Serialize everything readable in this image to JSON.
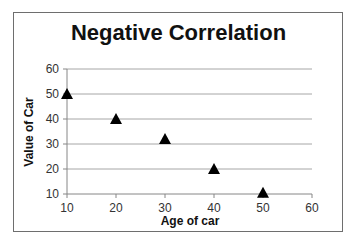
{
  "chart_data": {
    "type": "scatter",
    "title": "Negative Correlation",
    "xlabel": "Age of car",
    "ylabel": "Value of Car",
    "xlim": [
      10,
      60
    ],
    "ylim": [
      10,
      60
    ],
    "x_ticks": [
      10,
      20,
      30,
      40,
      50,
      60
    ],
    "y_ticks": [
      10,
      20,
      30,
      40,
      50,
      60
    ],
    "grid": {
      "horizontal": true,
      "vertical": false
    },
    "legend": null,
    "marker": "triangle",
    "marker_color": "#000000",
    "series": [
      {
        "name": "Value of Car",
        "x": [
          10,
          20,
          30,
          40,
          50
        ],
        "y": [
          50,
          40,
          32,
          20,
          10.5
        ]
      }
    ]
  },
  "colors": {
    "gridline": "#a6a6a6",
    "axis": "#868686",
    "border": "#6e6e6e",
    "marker": "#000000"
  }
}
